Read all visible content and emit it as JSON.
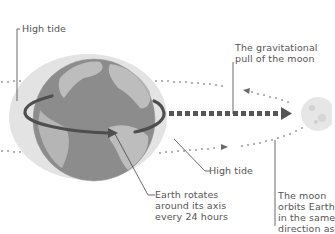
{
  "diagram": {
    "labels": {
      "high_tide_top": "High tide",
      "gravitational_pull": [
        "The gravitational",
        "pull of the moon"
      ],
      "high_tide_right": "High tide",
      "earth_rotates": [
        "Earth rotates",
        "around its axis",
        "every 24 hours"
      ],
      "moon_orbits": [
        "The moon",
        "orbits Earth",
        "in the same",
        "direction as"
      ]
    },
    "nodes": [
      {
        "id": "earth",
        "label": "Earth",
        "shape": "globe"
      },
      {
        "id": "tidal-bulge",
        "label": "Ocean tidal bulge",
        "shape": "ellipse"
      },
      {
        "id": "moon",
        "label": "Moon",
        "shape": "circle"
      }
    ],
    "edges": [
      {
        "from": "moon",
        "to": "earth",
        "style": "dashed-thick",
        "meaning": "gravitational pull"
      },
      {
        "from": "earth",
        "to": "earth",
        "style": "curved-arrow",
        "meaning": "rotation"
      },
      {
        "from": "moon",
        "to": "moon",
        "style": "dotted-orbit",
        "meaning": "moon orbit"
      }
    ],
    "colors": {
      "ocean": "#8a8a8a",
      "land": "#bdbdbd",
      "bulge": "#e3e3e3",
      "arrow": "#5a5a5a",
      "text": "#555555",
      "moon": "#e6e6e6"
    }
  }
}
